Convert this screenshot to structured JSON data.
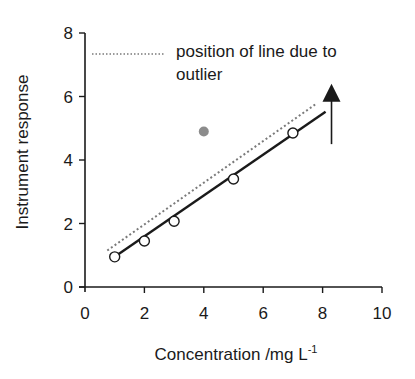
{
  "chart_data": {
    "type": "scatter",
    "title": "",
    "xlabel": "Concentration /mg L",
    "xlabel_superscript": "-1",
    "ylabel": "Instrument response",
    "xlim": [
      0,
      10
    ],
    "ylim": [
      0,
      8
    ],
    "x_ticks": [
      0,
      2,
      4,
      6,
      8,
      10
    ],
    "y_ticks": [
      0,
      2,
      4,
      6,
      8
    ],
    "grid": false,
    "series": [
      {
        "name": "calibration points",
        "marker": "open-circle",
        "x": [
          1,
          2,
          3,
          5,
          7
        ],
        "y": [
          0.95,
          1.45,
          2.07,
          3.4,
          4.85
        ]
      },
      {
        "name": "outlier",
        "marker": "filled-grey-circle",
        "x": [
          4
        ],
        "y": [
          4.9
        ]
      },
      {
        "name": "fitted line (without outlier)",
        "style": "solid",
        "x": [
          1,
          8.1
        ],
        "y": [
          0.95,
          5.52
        ]
      },
      {
        "name": "position of line due to outlier",
        "style": "dotted",
        "x": [
          0.75,
          7.8
        ],
        "y": [
          1.15,
          5.78
        ]
      }
    ],
    "annotations": [
      {
        "type": "arrow",
        "direction": "up",
        "x": 8.3,
        "y_from": 4.5,
        "y_to": 6.4
      }
    ],
    "legend": {
      "position": "top",
      "entries": [
        {
          "style": "dotted",
          "label_line1": "position of line due to",
          "label_line2": "outlier"
        }
      ]
    }
  },
  "colors": {
    "axis": "#1a1a1a",
    "fit_line": "#1a1a1a",
    "dotted_line": "#7a7a7a",
    "outlier": "#8c8c8c",
    "marker_fill": "#ffffff"
  }
}
